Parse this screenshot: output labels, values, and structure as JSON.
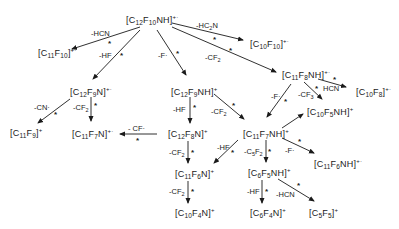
{
  "diagram": {
    "type": "fragmentation-scheme",
    "nodes": {
      "root": {
        "base": "[C12F10NH]",
        "charge": "+·"
      },
      "c10f10": {
        "base": "[C10F10]",
        "charge": "+·"
      },
      "c11f10": {
        "base": "[C11F10]",
        "charge": "+·"
      },
      "c12f9n": {
        "base": "[C12F9N]",
        "charge": "+·"
      },
      "c12f9nh": {
        "base": "[C12F9NH]",
        "charge": "+"
      },
      "c11f8nh": {
        "base": "[C11F8NH]",
        "charge": "+·"
      },
      "c10f8": {
        "base": "[C10F8]",
        "charge": "+·"
      },
      "c10f5nh": {
        "base": "[C10F5NH]",
        "charge": "+"
      },
      "c11f9": {
        "base": "[C11F9]",
        "charge": "+"
      },
      "c11f7n": {
        "base": "[C11F7N]",
        "charge": "+·"
      },
      "c12f8n": {
        "base": "[C12F8N]",
        "charge": "+"
      },
      "c11f7nh": {
        "base": "[C11F7NH]",
        "charge": "+"
      },
      "c11f6nh": {
        "base": "[C11F6NH]",
        "charge": "+·"
      },
      "c11f6n": {
        "base": "[C11F6N]",
        "charge": "+"
      },
      "c6f5nh": {
        "base": "[C6F5NH]",
        "charge": "+"
      },
      "c10f4n": {
        "base": "[C10F4N]",
        "charge": "+"
      },
      "c6f4n": {
        "base": "[C6F4N]",
        "charge": "+"
      },
      "c5f5": {
        "base": "[C5F5]",
        "charge": "+"
      }
    },
    "edges": [
      {
        "from": "root",
        "to": "c11f10",
        "label": "-HCN",
        "metastable": true
      },
      {
        "from": "root",
        "to": "c10f10",
        "label": "-HC2N",
        "metastable": true
      },
      {
        "from": "root",
        "to": "c12f9n",
        "label": "-HF",
        "metastable": true
      },
      {
        "from": "root",
        "to": "c12f9nh",
        "label": "-F·",
        "metastable": true
      },
      {
        "from": "root",
        "to": "c11f8nh",
        "label": "-CF2",
        "metastable": true
      },
      {
        "from": "c11f8nh",
        "to": "c10f8",
        "label": "HCN",
        "metastable": true
      },
      {
        "from": "c11f8nh",
        "to": "c10f5nh",
        "label": "-CF3",
        "metastable": true
      },
      {
        "from": "c11f8nh",
        "to": "c11f7nh",
        "label": "-F·",
        "metastable": true
      },
      {
        "from": "c12f9n",
        "to": "c11f9",
        "label": "-CN·",
        "metastable": true
      },
      {
        "from": "c12f9n",
        "to": "c11f7n",
        "label": "-CF2",
        "metastable": true
      },
      {
        "from": "c12f8n",
        "to": "c11f7n",
        "label": "-CF·",
        "metastable": true
      },
      {
        "from": "c12f9nh",
        "to": "c12f8n",
        "label": "-HF",
        "metastable": true
      },
      {
        "from": "c12f9nh",
        "to": "c11f7nh",
        "label": "-CF2",
        "metastable": true
      },
      {
        "from": "c12f8n",
        "to": "c11f6n",
        "label": "-CF2",
        "metastable": true
      },
      {
        "from": "c11f6n",
        "to": "c10f4n",
        "label": "-CF2",
        "metastable": true
      },
      {
        "from": "c11f7nh",
        "to": "c11f6n",
        "label": "-HF",
        "metastable": true
      },
      {
        "from": "c11f7nh",
        "to": "c6f5nh",
        "label": "-C5F2",
        "metastable": true
      },
      {
        "from": "c11f7nh",
        "to": "c10f5nh",
        "label": "",
        "metastable": false
      },
      {
        "from": "c11f7nh",
        "to": "c11f6nh",
        "label": "-F·",
        "metastable": true
      },
      {
        "from": "c6f5nh",
        "to": "c6f4n",
        "label": "-HF",
        "metastable": true
      },
      {
        "from": "c6f5nh",
        "to": "c5f5",
        "label": "-HCN",
        "metastable": true
      }
    ],
    "metastable_marker": "*"
  }
}
